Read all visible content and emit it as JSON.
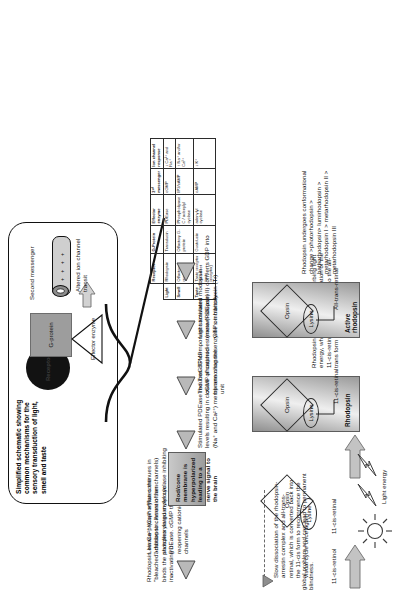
{
  "meta": {
    "figure_kind": "biology-schematic",
    "orientation_note": "page content rendered rotated 90 degrees"
  },
  "panel": {
    "title": "Simplified schematic showing common mechanisms for the sensory transduction of light, smell and taste",
    "receptor_label": "Receptor",
    "gprotein_label": "G-protein",
    "effector_label": "Effector enzyme",
    "second_messenger_label": "Second messenger",
    "channel_label": "Altered ion channel transit",
    "channel_dots": "+ + + +"
  },
  "table": {
    "headers": [
      "Receptor",
      "G-Protein",
      "Effector enzyme",
      "2ⁿᵈ messenger",
      "Ion channel response"
    ],
    "rows": [
      {
        "stimulus": "Light",
        "receptor": "Rhodopsin",
        "gprotein": "Transducin",
        "effector": "PDEase",
        "messenger": "cGMP",
        "channel": "↓ Ca²⁺ and Na⁺"
      },
      {
        "stimulus": "Smell",
        "receptor": "Olfactory receptor",
        "gprotein": "Olfactory G-protein",
        "effector": "Phospholipase C / adenylyl cyclase",
        "messenger": "IP3/cAMP",
        "channel": "↑ Na⁺ and/or Ca²⁺"
      },
      {
        "stimulus": "Taste",
        "receptor": "Taste receptor (ie sweet taste receptor)",
        "gprotein": "Gustducin",
        "effector": "adenylyl cyclase",
        "messenger": "cAMP",
        "channel": "↓ K⁺"
      }
    ]
  },
  "steps": {
    "recovery_1": "Rhodopsin kinase phosphorylates the \"bleached\" rhodopsin. Arrestin then binds the phosphorylated molecule inactivating it",
    "recovery_2": "Low Ca²⁺ (Ca²⁺ efflux continues in addition to closure of ion channels) switches on guanylyl cyclase inhibiting PDEase. cGMP therefore increase, reopening cationic membrane channels",
    "recovery_3": "Slow dissociation of the rhodopsin-arrestin complex and all-trans-retinal, which is converted back into the 11-cis form to recommence the visual cycle once again",
    "cascade_1": "Stimulated PDEase reduces cGMP levels resulting in closure of cationic (Na⁺ and Ca²⁺) membrane channels",
    "cascade_2": "The TrαGTP component stimulates cGMP phosphodiesterase (PDEase) by removing the enzyme's inhibitory unit",
    "cascade_3": "Light activated rhodopsin (metarhodopsin II) converts GDP into GTP on transducin (Tr)",
    "nerve_signal": "Rod/cone membrane is hyperpolarized leading to a nerve signal to the brain",
    "activation": "Rhodopsin is activated by absorbing light energy, which causes isomerization of the 11-cis-retinal bound to opsin into the all-trans form of retinal.",
    "conformational": "Rhodopsin undergoes conformational change >photorhodopsin > bathorhodopsin> lumirhodopsin > metarhodopsin I > metarhodopsin II > metarhodopsin III",
    "blindness": "global problem and can lead to permanent blindness."
  },
  "molecules": {
    "retinol_label": "11-cis-retinol",
    "retinal_label": "11-cis-retinal",
    "opsin": "Opsin",
    "lysine": "Lysine",
    "rhodopsin_box_label": "Rhodopsin",
    "rhodopsin_attached_label": "11-cis-retinal",
    "active_box_label": "Active rhodopsin",
    "active_attached_label": "All-trans-retinal",
    "light_energy": "Light energy"
  },
  "icons": {
    "sun": "sun-icon",
    "bolt": "lightning-bolt-icon",
    "arrow_right": "block-arrow-right-icon",
    "arrow_left": "triangle-arrow-left-icon",
    "arrow_down": "arrow-down-icon"
  },
  "colors": {
    "ink": "#111111",
    "grey_fill": "#9d9d9d",
    "panel_border": "#111111"
  }
}
